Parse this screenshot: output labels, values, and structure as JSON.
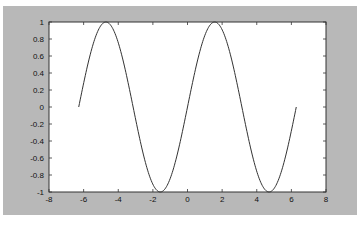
{
  "chart_data": {
    "type": "line",
    "title": "",
    "xlabel": "",
    "ylabel": "",
    "xlim": [
      -8,
      8
    ],
    "ylim": [
      -1,
      1
    ],
    "grid": false,
    "legend": null,
    "xticks": [
      "-8",
      "-6",
      "-4",
      "-2",
      "0",
      "2",
      "4",
      "6",
      "8"
    ],
    "yticks": [
      "-1",
      "-0.8",
      "-0.6",
      "-0.4",
      "-0.2",
      "0",
      "0.2",
      "0.4",
      "0.6",
      "0.8",
      "1"
    ],
    "series": [
      {
        "name": "sin(x)",
        "function": "y = sin(x)",
        "x_range": [
          -6.2832,
          6.2832
        ],
        "color": "#333333",
        "x": [
          -6.28,
          -5.5,
          -4.71,
          -3.93,
          -3.14,
          -2.36,
          -1.57,
          -0.79,
          0,
          0.79,
          1.57,
          2.36,
          3.14,
          3.93,
          4.71,
          5.5,
          6.28
        ],
        "y": [
          0,
          0.71,
          1,
          0.71,
          0,
          -0.71,
          -1,
          -0.71,
          0,
          0.71,
          1,
          0.71,
          0,
          -0.71,
          -1,
          -0.71,
          0
        ]
      }
    ]
  },
  "colors": {
    "figure_bg": "#b8b8b8",
    "axes_bg": "#ffffff",
    "line": "#333333"
  }
}
